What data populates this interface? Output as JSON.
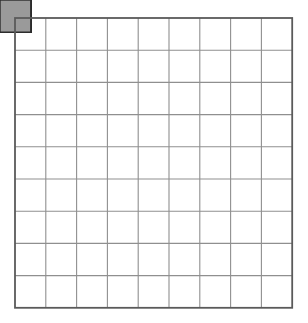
{
  "figure": {
    "kind": "geometric-tiling-diagram",
    "width": 308,
    "height": 323,
    "background_color": "#ffffff"
  },
  "grid": {
    "origin_x": 15,
    "origin_y": 18,
    "cell_width": 30.8,
    "cell_height": 32.2,
    "columns": 9,
    "rows": 9,
    "blocks_across": 3,
    "blocks_down": 3,
    "block_cells": 3,
    "line_color": "#8f8f8f",
    "line_width": 1.1,
    "border_color": "#5a5a5a",
    "border_width": 1.8
  },
  "palette": {
    "shade_fill": "#9a9a9a",
    "shade_stroke": "#2b2b2b",
    "shade_stroke_width": 1.4,
    "empty_fill": "#ffffff",
    "grid_line": "#8f8f8f",
    "frame": "#5a5a5a"
  },
  "block": {
    "name": "pinwheel-star-block",
    "description": "3x3 cell block: solid shaded center, four shaded half-square-triangle vanes on the edge-midpoint cells, four empty corner cells.",
    "cells": [
      {
        "row": 0,
        "col": 0,
        "shape": "empty",
        "name": "corner-top-left"
      },
      {
        "row": 0,
        "col": 1,
        "shape": "tri-bl",
        "name": "vane-top"
      },
      {
        "row": 0,
        "col": 2,
        "shape": "empty",
        "name": "corner-top-right"
      },
      {
        "row": 1,
        "col": 0,
        "shape": "tri-br",
        "name": "vane-left"
      },
      {
        "row": 1,
        "col": 1,
        "shape": "full",
        "name": "block-center"
      },
      {
        "row": 1,
        "col": 2,
        "shape": "tri-tl",
        "name": "vane-right"
      },
      {
        "row": 2,
        "col": 0,
        "shape": "empty",
        "name": "corner-bottom-left"
      },
      {
        "row": 2,
        "col": 1,
        "shape": "tri-tr",
        "name": "vane-bottom"
      },
      {
        "row": 2,
        "col": 2,
        "shape": "empty",
        "name": "corner-bottom-right"
      }
    ],
    "shape_legend": {
      "empty": "unshaded square",
      "full": "fully shaded square",
      "tri-bl": "shaded right triangle filling the bottom-left half",
      "tri-br": "shaded right triangle filling the bottom-right half",
      "tri-tl": "shaded right triangle filling the top-left half",
      "tri-tr": "shaded right triangle filling the top-right half"
    }
  },
  "blocks": [
    {
      "index": 0,
      "block_row": 0,
      "block_col": 0,
      "name": "block-r0-c0"
    },
    {
      "index": 1,
      "block_row": 0,
      "block_col": 1,
      "name": "block-r0-c1"
    },
    {
      "index": 2,
      "block_row": 0,
      "block_col": 2,
      "name": "block-r0-c2"
    },
    {
      "index": 3,
      "block_row": 1,
      "block_col": 0,
      "name": "block-r1-c0"
    },
    {
      "index": 4,
      "block_row": 1,
      "block_col": 1,
      "name": "block-r1-c1"
    },
    {
      "index": 5,
      "block_row": 1,
      "block_col": 2,
      "name": "block-r1-c2"
    },
    {
      "index": 6,
      "block_row": 2,
      "block_col": 0,
      "name": "block-r2-c0"
    },
    {
      "index": 7,
      "block_row": 2,
      "block_col": 1,
      "name": "block-r2-c1"
    },
    {
      "index": 8,
      "block_row": 2,
      "block_col": 2,
      "name": "block-r2-c2"
    }
  ]
}
